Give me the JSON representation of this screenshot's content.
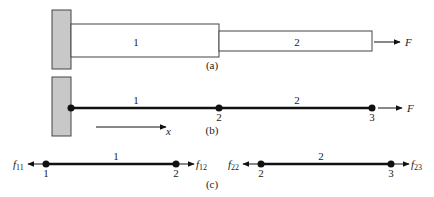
{
  "figure": {
    "panel_a": {
      "caption": "(a)",
      "element_labels": [
        "1",
        "2"
      ],
      "force_label": "F"
    },
    "panel_b": {
      "caption": "(b)",
      "element_labels": [
        "1",
        "2"
      ],
      "node_labels": [
        "2",
        "3"
      ],
      "force_label": "F",
      "axis_label": "x"
    },
    "panel_c": {
      "caption": "(c)",
      "element1": {
        "label": "1",
        "node_left": "1",
        "node_right": "2",
        "force_left": {
          "base": "f",
          "sub": "11"
        },
        "force_right": {
          "base": "f",
          "sub": "12"
        }
      },
      "element2": {
        "label": "2",
        "node_left": "2",
        "node_right": "3",
        "force_left": {
          "base": "f",
          "sub": "22"
        },
        "force_right": {
          "base": "f",
          "sub": "23"
        }
      }
    },
    "colors": {
      "wall_fill": "#c8c8c8",
      "stroke": "#333333",
      "line": "#111111"
    }
  }
}
